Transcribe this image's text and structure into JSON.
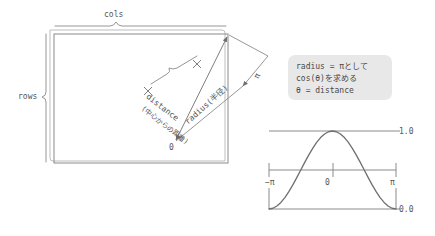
{
  "diagram": {
    "grid": {
      "cols_label": "cols",
      "rows_label": "rows"
    },
    "annotations": {
      "origin_label": "0",
      "pi_label": "π",
      "distance_label": "distance",
      "distance_label_jp": "(中心からの距離)",
      "radius_label": "radius(半径)"
    }
  },
  "note": {
    "line1": "radius = πとして",
    "line2": "cos(θ)を求める",
    "line3": "θ = distance",
    "background_color": "#e8e8e8"
  },
  "chart_data": {
    "type": "line",
    "title": "",
    "xlabel": "",
    "ylabel": "",
    "x_tick_labels": [
      "−π",
      "0",
      "π"
    ],
    "y_tick_labels": [
      "1.0",
      "0.0"
    ],
    "xlim": [
      -3.141592653589793,
      3.141592653589793
    ],
    "ylim": [
      0.0,
      1.0
    ],
    "grid": false,
    "legend": "none",
    "series": [
      {
        "name": "(cos(θ)+1)/2",
        "x": [
          -3.1416,
          -2.9452,
          -2.7489,
          -2.5525,
          -2.3562,
          -2.1598,
          -1.9635,
          -1.7671,
          -1.5708,
          -1.3744,
          -1.1781,
          -0.9817,
          -0.7854,
          -0.589,
          -0.3927,
          -0.1963,
          0.0,
          0.1963,
          0.3927,
          0.589,
          0.7854,
          0.9817,
          1.1781,
          1.3744,
          1.5708,
          1.7671,
          1.9635,
          2.1598,
          2.3562,
          2.5525,
          2.7489,
          2.9452,
          3.1416
        ],
        "y": [
          0.0,
          0.0096,
          0.0381,
          0.0843,
          0.1464,
          0.2222,
          0.3087,
          0.4025,
          0.5,
          0.5975,
          0.6913,
          0.7778,
          0.8536,
          0.9157,
          0.9619,
          0.9904,
          1.0,
          0.9904,
          0.9619,
          0.9157,
          0.8536,
          0.7778,
          0.6913,
          0.5975,
          0.5,
          0.4025,
          0.3087,
          0.2222,
          0.1464,
          0.0843,
          0.0381,
          0.0096,
          0.0
        ]
      }
    ],
    "line_color": "#6f6f6f",
    "axis_color": "#8a8a8a"
  },
  "colors": {
    "stroke": "#8a8a8a",
    "text": "#555555",
    "curve": "#6f6f6f"
  }
}
